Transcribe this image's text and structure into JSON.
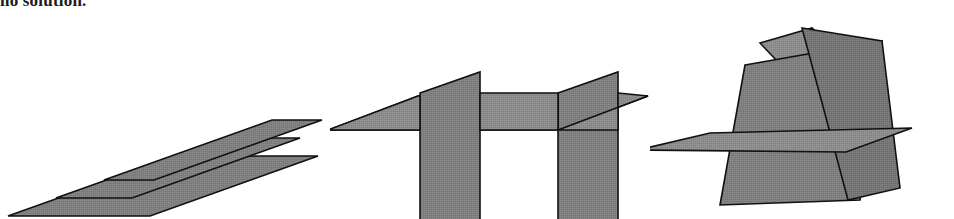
{
  "caption": {
    "text": "no solution."
  },
  "colors": {
    "background": "#ffffff",
    "plane_fill": "#808080",
    "plane_fill_light": "#8c8c8c",
    "plane_fill_dark": "#747474",
    "plane_stroke": "#111111",
    "caption_color": "#1a1a1a"
  },
  "figures": [
    {
      "id": "figure-parallel-planes",
      "name": "three-parallel-planes",
      "description": "Three mutually parallel planes drawn as offset parallelograms, no common point of intersection.",
      "plane_count": 3,
      "planes": [
        {
          "label": "plane-bottom",
          "points": "10,214 172,152 318,152 156,214",
          "fill": "#808080"
        },
        {
          "label": "plane-middle",
          "points": "68,196 230,134 376,134 214,196",
          "fill": "#808080"
        },
        {
          "label": "plane-top",
          "points": "126,178 288,116 434,116 272,178",
          "fill": "#808080"
        }
      ]
    },
    {
      "id": "figure-two-parallel-cut",
      "name": "two-parallel-planes-cut-by-third",
      "description": "Two parallel vertical planes intersected by a single horizontal plane; the intersection lines are parallel so there is no common point.",
      "plane_count": 3,
      "planes": [
        {
          "label": "horizontal-plane",
          "points": "8,128 120,96 320,96 208,128",
          "fill": "#8c8c8c"
        },
        {
          "label": "vertical-plane-left",
          "points": "88,92 148,74 148,226 88,226",
          "fill": "#808080"
        },
        {
          "label": "vertical-plane-right",
          "points": "226,92 286,74 286,226 226,226",
          "fill": "#808080"
        }
      ]
    },
    {
      "id": "figure-triangular-prism",
      "name": "three-planes-forming-triangular-prism",
      "description": "Three planes meeting pairwise in three parallel lines, forming an open triangular prism; no common point of intersection.",
      "plane_count": 3,
      "planes": [
        {
          "label": "plane-lower-horizontal",
          "fill": "#8c8c8c"
        },
        {
          "label": "plane-left-slanted",
          "fill": "#808080"
        },
        {
          "label": "plane-right-slanted",
          "fill": "#747474"
        }
      ]
    }
  ]
}
